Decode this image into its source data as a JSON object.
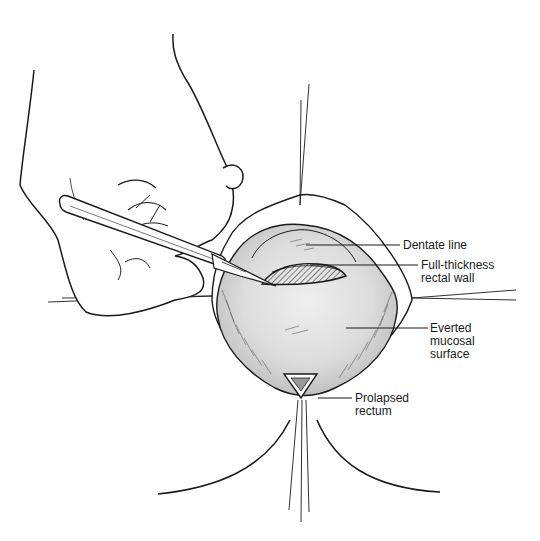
{
  "figure": {
    "type": "surgical-illustration",
    "colors": {
      "line": "#1a1a1a",
      "tissue_fill": "#d9d9d9",
      "tissue_light": "#ececec",
      "incision_fill": "#8a8a8a",
      "background": "#ffffff"
    }
  },
  "labels": {
    "dentate_line": "Dentate line",
    "full_thickness": [
      "Full-thickness",
      "rectal wall"
    ],
    "everted_mucosal": [
      "Everted",
      "mucosal",
      "surface"
    ],
    "prolapsed_rectum": [
      "Prolapsed",
      "rectum"
    ]
  },
  "elements": {
    "hand": "hand-holding-scalpel",
    "scalpel": "scalpel",
    "retraction_sutures": 4,
    "clamp": "triangular-clamp"
  }
}
